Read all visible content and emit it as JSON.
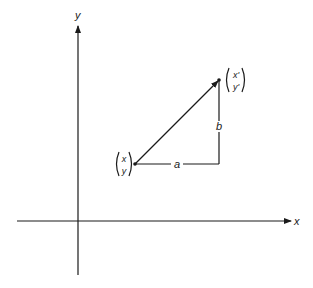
{
  "diagram": {
    "axes": {
      "x_label": "x",
      "y_label": "y"
    },
    "points": {
      "start": {
        "top": "x",
        "bottom": "y"
      },
      "end": {
        "top": "x'",
        "bottom": "y'"
      }
    },
    "segments": {
      "horizontal_label": "a",
      "vertical_label": "b"
    },
    "colors": {
      "ink": "#1a1a1a",
      "background": "#ffffff"
    }
  }
}
